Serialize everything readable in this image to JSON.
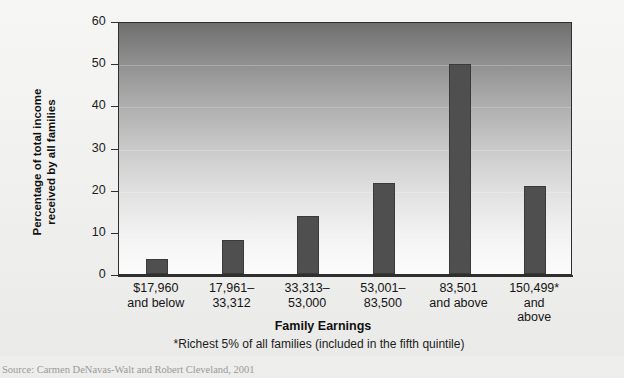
{
  "chart_data": {
    "type": "bar",
    "title": "",
    "xlabel": "Family Earnings",
    "ylabel": "Percentage of total income\nreceived by all families",
    "ylim": [
      0,
      60
    ],
    "yticks": [
      0,
      10,
      20,
      30,
      40,
      50,
      60
    ],
    "ytick_labels": [
      "0",
      "10",
      "20",
      "30",
      "40",
      "50",
      "60"
    ],
    "grid": "faint-horizontal",
    "legend": "none",
    "categories": [
      "$17,960\nand below",
      "17,961–\n33,312",
      "33,313–\n53,000",
      "53,001–\n83,500",
      "83,501\nand above",
      "150,499*\nand\nabove"
    ],
    "values": [
      3.5,
      8.0,
      13.8,
      21.6,
      49.7,
      20.8
    ],
    "bar_color": "#4f4f4f",
    "plot_background": "vertical gradient dark-gray to white",
    "footnote": "*Richest 5% of all families (included in the fifth quintile)",
    "source": "Source: Carmen DeNavas-Walt and Robert Cleveland, 2001"
  },
  "axes": {
    "y_title": "Percentage of total income\nreceived by all families",
    "x_title": "Family Earnings"
  },
  "notes": {
    "footnote": "*Richest 5% of all families (included in the fifth quintile)",
    "source": "Source: Carmen DeNavas-Walt and Robert Cleveland, 2001"
  },
  "colors": {
    "bar": "#4f4f4f",
    "axis": "#2f2f2f",
    "page": "#f2f2f0"
  }
}
